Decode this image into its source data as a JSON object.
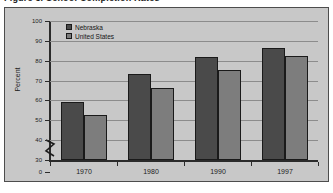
{
  "figure": {
    "caption": "Figure 3. School Completion Rates"
  },
  "legend": {
    "position": "top-left-inside",
    "entries": [
      {
        "label": "Nebraska",
        "color": "#4a4a4a"
      },
      {
        "label": "United States",
        "color": "#7d7d7d"
      }
    ]
  },
  "axes": {
    "ylabel": "Percent",
    "xlabel": "",
    "y_ticks": [
      0,
      30,
      40,
      50,
      60,
      70,
      80,
      90,
      100
    ],
    "y_break_between": [
      0,
      30
    ],
    "grid": true
  },
  "chart_data": {
    "type": "bar",
    "title": "Figure 3. School Completion Rates",
    "xlabel": "",
    "ylabel": "Percent",
    "categories": [
      "1970",
      "1980",
      "1990",
      "1997"
    ],
    "series": [
      {
        "name": "Nebraska",
        "color": "#4a4a4a",
        "values": [
          59,
          73.5,
          82,
          86.5
        ]
      },
      {
        "name": "United States",
        "color": "#7d7d7d",
        "values": [
          52.5,
          66.5,
          75.5,
          82.5
        ]
      }
    ],
    "ylim": [
      30,
      100
    ],
    "y_ticks": [
      0,
      30,
      40,
      50,
      60,
      70,
      80,
      90,
      100
    ],
    "axis_break": {
      "from": 0,
      "to": 30
    },
    "grid": true,
    "legend_position": "upper left"
  }
}
